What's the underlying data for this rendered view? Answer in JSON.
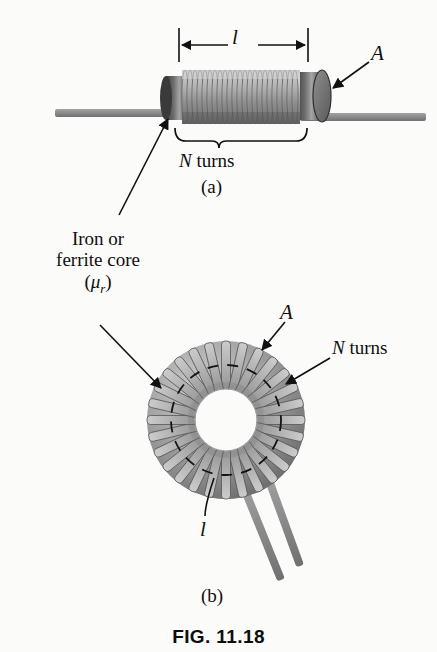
{
  "figure": {
    "caption": "FIG. 11.18",
    "background_color": "#fbfbfa",
    "ink_color": "#111111",
    "metal_light": "#c9c9c9",
    "metal_mid": "#9a9a9a",
    "metal_dark": "#5d5d5d",
    "wire_color": "#8a8a8a"
  },
  "part_a": {
    "caption": "(a)",
    "length_label": "l",
    "area_label": "A",
    "turns_label_italic": "N",
    "turns_label_rest": " turns",
    "turns_label_full": "N turns",
    "coil_turn_count": 22
  },
  "part_b": {
    "caption": "(b)",
    "area_label": "A",
    "turns_label_italic": "N",
    "turns_label_rest": " turns",
    "turns_label_full": "N turns",
    "length_label": "l",
    "winding_count": 28
  },
  "core_annotation": {
    "line1": "Iron or",
    "line2": "ferrite core",
    "mu_symbol": "μ",
    "mu_subscript": "r",
    "paren_open": "(",
    "paren_close": ")",
    "full_text": "Iron or ferrite core (μr)"
  }
}
